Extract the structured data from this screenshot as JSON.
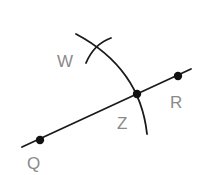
{
  "diagram": {
    "type": "geometric-construction",
    "colors": {
      "line": "#1a1a1a",
      "point": "#111111",
      "label": "#8a8a8a",
      "background": "#ffffff"
    },
    "points": [
      {
        "id": "Q",
        "label": "Q",
        "x": 40,
        "y": 140
      },
      {
        "id": "Z",
        "label": "Z",
        "x": 137,
        "y": 94
      },
      {
        "id": "R",
        "label": "R",
        "x": 178,
        "y": 76
      }
    ],
    "unmarked_points": [
      {
        "id": "W",
        "label": "W"
      }
    ],
    "line": {
      "through": [
        "Q",
        "Z",
        "R"
      ]
    },
    "arcs": [
      {
        "description": "arc through Z intersecting line QR"
      },
      {
        "description": "small arc crossing first arc near W"
      }
    ],
    "labels": {
      "W": "W",
      "Z": "Z",
      "R": "R",
      "Q": "Q"
    }
  }
}
